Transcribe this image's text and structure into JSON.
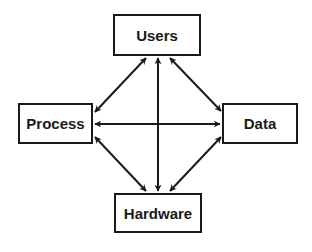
{
  "diagram": {
    "type": "network",
    "nodes": [
      {
        "id": "users",
        "label": "Users"
      },
      {
        "id": "process",
        "label": "Process"
      },
      {
        "id": "data",
        "label": "Data"
      },
      {
        "id": "hardware",
        "label": "Hardware"
      }
    ],
    "edges": [
      {
        "from": "users",
        "to": "process",
        "bidirectional": true
      },
      {
        "from": "users",
        "to": "hardware",
        "bidirectional": true
      },
      {
        "from": "users",
        "to": "data",
        "bidirectional": true
      },
      {
        "from": "process",
        "to": "data",
        "bidirectional": true
      },
      {
        "from": "process",
        "to": "hardware",
        "bidirectional": true
      },
      {
        "from": "data",
        "to": "hardware",
        "bidirectional": true
      }
    ],
    "colors": {
      "stroke": "#1a1a1a",
      "background": "#ffffff"
    }
  }
}
